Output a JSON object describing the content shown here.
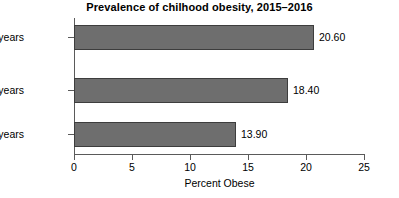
{
  "chart_data": {
    "type": "bar",
    "orientation": "horizontal",
    "title": "Prevalence of chilhood obesity, 2015–2016",
    "xlabel": "Percent Obese",
    "ylabel": "",
    "categories": [
      "2–5 years",
      "6–11 years",
      "12–19 years"
    ],
    "values": [
      13.9,
      18.4,
      20.6
    ],
    "value_labels": [
      "13.90",
      "18.40",
      "20.60"
    ],
    "bars": [
      {
        "category": "12–19 years",
        "value": 20.6,
        "label": "20.60"
      },
      {
        "category": "6–11 years",
        "value": 18.4,
        "label": "18.40"
      },
      {
        "category": "2–5 years",
        "value": 13.9,
        "label": "13.90"
      }
    ],
    "xlim": [
      0,
      25
    ],
    "xticks": [
      0,
      5,
      10,
      15,
      20,
      25
    ],
    "xtick_labels": [
      "0",
      "5",
      "10",
      "15",
      "20",
      "25"
    ],
    "grid": false,
    "legend": false,
    "bar_fill_color": "#6e6e6e",
    "bar_edge_color": "#3d3d3d",
    "axis_color": "#5a5a5a",
    "background_color": "#ffffff",
    "text_color": "#000000"
  }
}
